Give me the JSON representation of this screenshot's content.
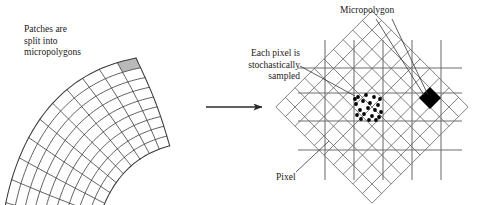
{
  "figure": {
    "background_color": "#ffffff",
    "width": 480,
    "height": 205
  },
  "labels": {
    "patches": "Patches are\nsplit into\nmicropolygons",
    "each_pixel": "Each pixel is\nstochastically\nsampled",
    "micropolygon": "Micropolygon",
    "pixel": "Pixel"
  },
  "colors": {
    "ink": "#1a1a1a",
    "grid_line": "#3a3a3a",
    "pixel_grid_line": "#6e6e6e",
    "highlight_cell_fill": "#b9b9b9",
    "micropolygon_fill": "#000000",
    "sample_dot": "#000000",
    "background": "#ffffff"
  },
  "left_panel": {
    "name": "curved-patch",
    "description": "Curved annular-sector patch tessellated into a quadrilateral micropolygon grid",
    "rows": 9,
    "columns": 11,
    "highlighted_cell": {
      "row": 8,
      "column": 10,
      "fill": "#b9b9b9"
    }
  },
  "arrow": {
    "name": "transform-arrow",
    "direction": "right",
    "x1": 206,
    "y1": 107,
    "x2": 266,
    "y2": 107
  },
  "right_panel": {
    "name": "pixel-grid-with-micropolygons",
    "pixel_grid": {
      "vertical_lines": [
        325,
        354,
        383,
        412,
        441
      ],
      "horizontal_lines": [
        68,
        93,
        121,
        150
      ],
      "extent": {
        "x1": 298,
        "y1": 40,
        "x2": 462,
        "y2": 180
      }
    },
    "micropolygon_grid": {
      "rotation_degrees": 45,
      "center_x": 372,
      "center_y": 107,
      "half_size": 68,
      "divisions": 10
    },
    "black_micropolygon": {
      "cx": 430,
      "cy": 98,
      "r": 11
    },
    "sample_dots": {
      "count": 20,
      "pixel_bounds": {
        "x1": 354,
        "y1": 93,
        "x2": 383,
        "y2": 121
      },
      "points": [
        [
          358,
          97
        ],
        [
          366,
          95
        ],
        [
          374,
          97
        ],
        [
          380,
          99
        ],
        [
          356,
          104
        ],
        [
          363,
          101
        ],
        [
          370,
          103
        ],
        [
          378,
          105
        ],
        [
          360,
          110
        ],
        [
          368,
          108
        ],
        [
          375,
          110
        ],
        [
          381,
          112
        ],
        [
          357,
          115
        ],
        [
          364,
          114
        ],
        [
          372,
          116
        ],
        [
          379,
          117
        ],
        [
          361,
          119
        ],
        [
          369,
          120
        ],
        [
          376,
          120
        ],
        [
          355,
          99
        ]
      ]
    },
    "leader_lines": [
      {
        "name": "eachpixel-leader",
        "x1": 300,
        "y1": 66,
        "x2": 355,
        "y2": 96
      },
      {
        "name": "micropolygon-leader-left",
        "x1": 376,
        "y1": 19,
        "x2": 424,
        "y2": 95
      },
      {
        "name": "micropolygon-leader-right",
        "x1": 392,
        "y1": 19,
        "x2": 428,
        "y2": 95
      },
      {
        "name": "pixel-leader",
        "x1": 296,
        "y1": 172,
        "x2": 329,
        "y2": 141
      }
    ]
  }
}
